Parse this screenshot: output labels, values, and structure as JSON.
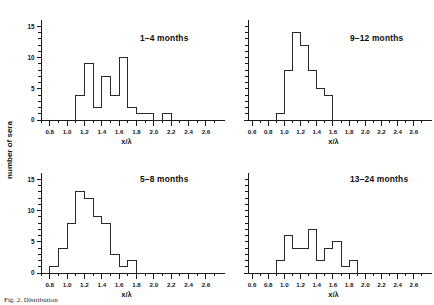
{
  "figure": {
    "y_axis_title": "number of sera",
    "x_axis_title": "x/λ",
    "caption_label": "Fig. 2.",
    "caption_text": "Distribution"
  },
  "chart_data": [
    {
      "type": "bar",
      "title": "1–4 months",
      "panel": "top-left",
      "xlabel": "x/λ",
      "ylabel": "number of sera",
      "xlim": [
        0.7,
        2.75
      ],
      "ylim": [
        0,
        16
      ],
      "xticks": [
        0.8,
        1.0,
        1.2,
        1.4,
        1.6,
        1.8,
        2.0,
        2.2,
        2.4,
        2.6
      ],
      "xtick_labels": [
        "0.8",
        "1.0",
        "1.2",
        "1.4",
        "1.6",
        "1.8",
        "2.0",
        "2.2",
        "2.4",
        "2.6"
      ],
      "yticks": [
        0,
        5,
        10,
        15
      ],
      "ytick_labels": [
        "0",
        "5",
        "10",
        "15"
      ],
      "y_minor_step": 1,
      "x_minor_step": 0.1,
      "bin_width": 0.1,
      "bin_starts": [
        1.1,
        1.2,
        1.3,
        1.4,
        1.5,
        1.6,
        1.7,
        1.8,
        1.9,
        2.0,
        2.1
      ],
      "values": [
        4,
        9,
        2,
        7,
        4,
        10,
        2,
        1,
        1,
        0,
        1
      ],
      "grid": false,
      "legend": "none"
    },
    {
      "type": "bar",
      "title": "9–12 months",
      "panel": "top-right",
      "xlabel": "x/λ",
      "ylabel": "",
      "xlim": [
        0.55,
        2.75
      ],
      "ylim": [
        0,
        16
      ],
      "xticks": [
        0.6,
        0.8,
        1.0,
        1.2,
        1.4,
        1.6,
        1.8,
        2.0,
        2.2,
        2.4,
        2.6
      ],
      "xtick_labels": [
        "0.6",
        "0.8",
        "1.0",
        "1.2",
        "1.4",
        "1.6",
        "1.8",
        "2.0",
        "2.2",
        "2.4",
        "2.6"
      ],
      "yticks": [],
      "ytick_labels": [],
      "y_minor_step": 1,
      "x_minor_step": 0.1,
      "bin_width": 0.1,
      "bin_starts": [
        0.9,
        1.0,
        1.1,
        1.2,
        1.3,
        1.4,
        1.5,
        1.6
      ],
      "values": [
        1,
        8,
        14,
        12,
        8,
        5,
        4,
        0
      ],
      "grid": false,
      "legend": "none"
    },
    {
      "type": "bar",
      "title": "5–8 months",
      "panel": "bottom-left",
      "xlabel": "x/λ",
      "ylabel": "number of sera",
      "xlim": [
        0.7,
        2.75
      ],
      "ylim": [
        0,
        16
      ],
      "xticks": [
        0.8,
        1.0,
        1.2,
        1.4,
        1.6,
        1.8,
        2.0,
        2.2,
        2.4,
        2.6
      ],
      "xtick_labels": [
        "0.8",
        "1.0",
        "1.2",
        "1.4",
        "1.6",
        "1.8",
        "2.0",
        "2.2",
        "2.4",
        "2.6"
      ],
      "yticks": [
        0,
        5,
        10,
        15
      ],
      "ytick_labels": [
        "0",
        "5",
        "10",
        "15"
      ],
      "y_minor_step": 1,
      "x_minor_step": 0.1,
      "bin_width": 0.1,
      "bin_starts": [
        0.8,
        0.9,
        1.0,
        1.1,
        1.2,
        1.3,
        1.4,
        1.5,
        1.6,
        1.7,
        1.8
      ],
      "values": [
        1,
        4,
        8,
        13,
        12,
        9,
        8,
        3,
        1,
        2,
        0
      ],
      "grid": false,
      "legend": "none"
    },
    {
      "type": "bar",
      "title": "13–24 months",
      "panel": "bottom-right",
      "xlabel": "x/λ",
      "ylabel": "",
      "xlim": [
        0.55,
        2.75
      ],
      "ylim": [
        0,
        16
      ],
      "xticks": [
        0.6,
        0.8,
        1.0,
        1.2,
        1.4,
        1.6,
        1.8,
        2.0,
        2.2,
        2.4,
        2.6
      ],
      "xtick_labels": [
        "0.6",
        "0.8",
        "1.0",
        "1.2",
        "1.4",
        "1.6",
        "1.8",
        "2.0",
        "2.2",
        "2.4",
        "2.6"
      ],
      "yticks": [],
      "ytick_labels": [],
      "y_minor_step": 1,
      "x_minor_step": 0.1,
      "bin_width": 0.1,
      "bin_starts": [
        0.9,
        1.0,
        1.1,
        1.2,
        1.3,
        1.4,
        1.5,
        1.6,
        1.7,
        1.8
      ],
      "values": [
        2,
        6,
        4,
        4,
        7,
        2,
        4,
        5,
        1,
        2
      ],
      "grid": false,
      "legend": "none"
    }
  ]
}
